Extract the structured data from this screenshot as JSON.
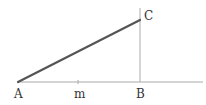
{
  "diagram": {
    "type": "geometry",
    "points": {
      "A": {
        "label": "A",
        "x": 18,
        "y": 82
      },
      "m": {
        "label": "m",
        "x": 78,
        "y": 82
      },
      "B": {
        "label": "B",
        "x": 140,
        "y": 82
      },
      "C": {
        "label": "C",
        "x": 140,
        "y": 20
      }
    },
    "labels": {
      "A": "A",
      "m": "m",
      "B": "B",
      "C": "C"
    },
    "colors": {
      "hypotenuse": "#555555",
      "baseline": "#aaaaaa",
      "vertical": "#aaaaaa",
      "text": "#333333"
    }
  }
}
